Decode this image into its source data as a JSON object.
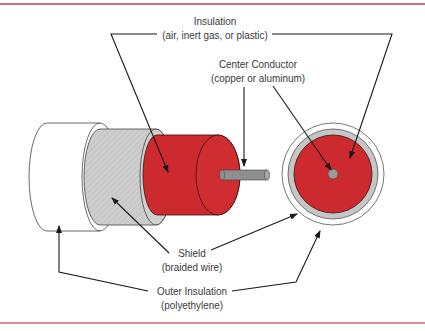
{
  "diagram": {
    "colors": {
      "dielectric": "#cc2a2e",
      "shield": "#c6c6c6",
      "outer_jacket": "#ffffff",
      "conductor": "#8f8f8f",
      "rule": "#d0707a",
      "line": "#1a1a1a"
    },
    "labels": {
      "insulation": {
        "title": "Insulation",
        "subtitle": "(air, inert gas, or plastic)"
      },
      "center_conductor": {
        "title": "Center Conductor",
        "subtitle": "(copper or aluminum)"
      },
      "shield": {
        "title": "Shield",
        "subtitle": "(braided wire)"
      },
      "outer_insulation": {
        "title": "Outer Insulation",
        "subtitle": "(polyethylene)"
      }
    }
  }
}
